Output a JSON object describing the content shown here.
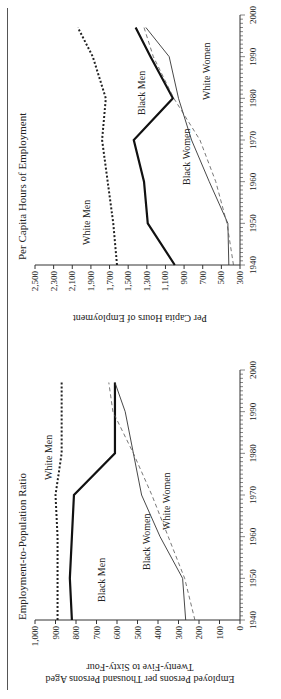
{
  "chart_data": [
    {
      "type": "line",
      "title": "Employment-to-Population Ratio",
      "xlabel": "",
      "ylabel": "Employed Persons per Thousand Persons Aged Twenty-Five to Sixty-Four",
      "x": [
        1940,
        1950,
        1960,
        1970,
        1980,
        1990,
        1997
      ],
      "xlim": [
        1940,
        2000
      ],
      "xticks": [
        "1940",
        "1950",
        "1960",
        "1970",
        "1980",
        "1990",
        "2000"
      ],
      "ylim": [
        0,
        1000
      ],
      "yticks": [
        "0",
        "100",
        "200",
        "300",
        "400",
        "500",
        "600",
        "700",
        "800",
        "900",
        "1,000"
      ],
      "grid": false,
      "series": [
        {
          "name": "White Men",
          "style": "dotted-bold",
          "values": [
            890,
            890,
            890,
            900,
            870,
            870,
            870
          ]
        },
        {
          "name": "Black Men",
          "style": "solid-bold",
          "values": [
            820,
            830,
            820,
            810,
            610,
            610,
            610
          ]
        },
        {
          "name": "Black Women",
          "style": "solid-thin",
          "values": [
            265,
            280,
            390,
            480,
            520,
            560,
            610
          ]
        },
        {
          "name": "White Women",
          "style": "dashed-thin",
          "values": [
            220,
            270,
            350,
            430,
            520,
            620,
            640
          ]
        }
      ],
      "annotations": [
        "White Men",
        "Black Men",
        "Black Women",
        "White Women"
      ]
    },
    {
      "type": "line",
      "title": "Per Capita Hours of Employment",
      "xlabel": "",
      "ylabel": "Per Capita Hours of Employment",
      "x": [
        1940,
        1950,
        1960,
        1970,
        1980,
        1990,
        1997
      ],
      "xlim": [
        1940,
        2000
      ],
      "xticks": [
        "1940",
        "1950",
        "1960",
        "1970",
        "1980",
        "1990",
        "2000"
      ],
      "ylim": [
        300,
        2500
      ],
      "yticks": [
        "300",
        "500",
        "700",
        "900",
        "1,100",
        "1,300",
        "1,500",
        "1,700",
        "1,900",
        "2,100",
        "2,300",
        "2,500"
      ],
      "grid": false,
      "series": [
        {
          "name": "White Men",
          "style": "dotted-bold",
          "values": [
            1620,
            1660,
            1720,
            1780,
            1740,
            1880,
            2040
          ]
        },
        {
          "name": "Black Men",
          "style": "solid-bold",
          "values": [
            1000,
            1290,
            1330,
            1440,
            1020,
            1260,
            1420
          ]
        },
        {
          "name": "Black Women",
          "style": "solid-thin",
          "values": [
            420,
            430,
            630,
            820,
            960,
            1060,
            1310
          ]
        },
        {
          "name": "White Women",
          "style": "dashed-thin",
          "values": [
            370,
            440,
            560,
            730,
            1010,
            1230,
            1330
          ]
        }
      ],
      "annotations": [
        "White Men",
        "Black Men",
        "Black Women",
        "White Women"
      ]
    }
  ],
  "labels": {
    "epop_title": "Employment-to-Population Ratio",
    "epop_ylabel_1": "Employed Persons per Thousand Persons Aged",
    "epop_ylabel_2": "Twenty-Five to Sixty-Four",
    "hours_title": "Per Capita Hours of Employment",
    "hours_ylabel": "Per Capita Hours of Employment",
    "white_men": "White Men",
    "black_men": "Black Men",
    "black_women": "Black Women",
    "white_women": "White Women"
  }
}
